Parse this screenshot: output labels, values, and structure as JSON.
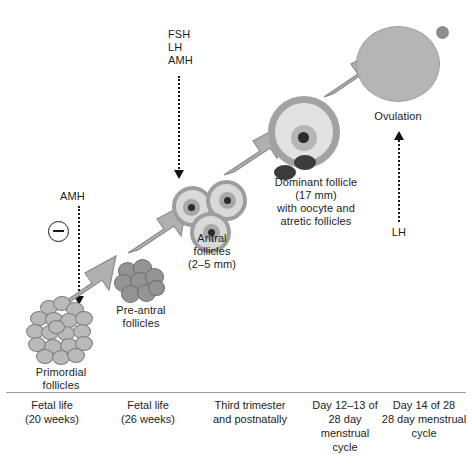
{
  "annotations": {
    "amh_left": "AMH",
    "fsh_lh_amh": "FSH\nLH\nAMH",
    "ovulation": "Ovulation",
    "lh": "LH"
  },
  "stages": [
    {
      "id": "primordial",
      "label": "Primordial\nfollicles",
      "timing": "Fetal life\n(20 weeks)"
    },
    {
      "id": "pre-antral",
      "label": "Pre-antral\nfollicles",
      "timing": "Fetal life\n(26 weeks)"
    },
    {
      "id": "antral",
      "label": "Antral\nfollicles\n(2–5 mm)",
      "timing": "Third trimester\nand postnatally"
    },
    {
      "id": "dominant",
      "label": "Dominant follicle\n(17 mm)\nwith oocyte and\natretic follicles",
      "timing": "Day 12–13 of\n28 day\nmenstrual\ncycle"
    },
    {
      "id": "ovulated",
      "label": "",
      "timing": "Day 14 of 28\n28 day menstrual\ncycle"
    }
  ],
  "colors": {
    "background": "#ffffff",
    "text": "#1d1d1d",
    "divider": "#9a9a9a",
    "follicle_light": "#d9d9d9",
    "follicle_mid": "#b5b5b5",
    "follicle_ring": "#9d9d9d",
    "atretic_dark": "#3c3c3c",
    "arrow_gray": "#a5a5a5"
  }
}
